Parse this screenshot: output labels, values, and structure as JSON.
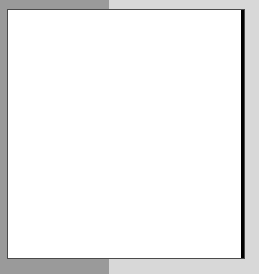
{
  "canvas": {
    "width": 259,
    "height": 274,
    "background_left_color": "#9a9a9a",
    "background_right_color": "#d8d8d8",
    "background_split_x": 109
  },
  "plot": {
    "left": 7,
    "top": 9,
    "width": 238,
    "height": 250,
    "border_color": "#4a4a4a",
    "background_color": "#ffffff"
  },
  "chart_data": {
    "type": "heatmap",
    "title": "",
    "subtitle": "",
    "xlabel": "",
    "ylabel": "",
    "automaton": {
      "rule": 60,
      "rule_binary": "00111100",
      "states": 2,
      "neighborhood": 3,
      "seed": "single-cell",
      "seed_position": "right-edge",
      "growth_direction": "left",
      "columns": 88,
      "rows": 92,
      "cell_size_px": 2.7
    },
    "colors": {
      "on": "#000000",
      "off": "#ffffff"
    },
    "legend": [
      {
        "label": "on",
        "color": "#000000",
        "value": 1
      },
      {
        "label": "off",
        "color": "#ffffff",
        "value": 0
      }
    ],
    "grid": false,
    "xlim": [
      0,
      88
    ],
    "ylim": [
      0,
      92
    ],
    "categories": [
      "cell-off",
      "cell-on"
    ],
    "values": [
      0,
      1
    ]
  }
}
